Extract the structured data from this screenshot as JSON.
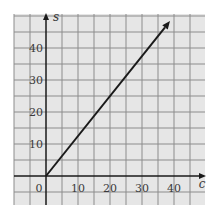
{
  "chart_data": {
    "type": "line",
    "title": "",
    "xlabel": "c",
    "ylabel": "s",
    "xlim": [
      -10,
      50
    ],
    "ylim": [
      -10,
      50
    ],
    "grid": true,
    "grid_step": 5,
    "x_ticks": [
      "0",
      "10",
      "20",
      "30",
      "40"
    ],
    "y_ticks": [
      "10",
      "20",
      "30",
      "40"
    ],
    "series": [
      {
        "name": "s = 1.25c",
        "x": [
          0,
          38.75
        ],
        "y": [
          0,
          48.4
        ],
        "arrow_end": true
      }
    ]
  },
  "colors": {
    "background": "#e6e6e6",
    "grid": "#8c8c8c",
    "axis": "#1a1a1a",
    "line": "#1a1a1a"
  }
}
